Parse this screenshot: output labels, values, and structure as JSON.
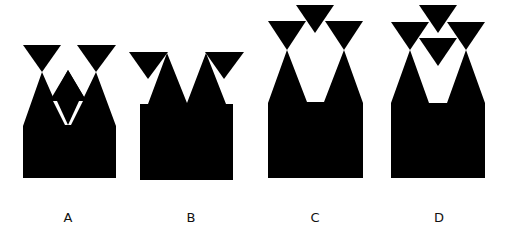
{
  "figures": [
    {
      "id": "A",
      "label": "A",
      "label_x": 68
    },
    {
      "id": "B",
      "label": "B",
      "label_x": 191
    },
    {
      "id": "C",
      "label": "C",
      "label_x": 315
    },
    {
      "id": "D",
      "label": "D",
      "label_x": 439
    }
  ],
  "colors": {
    "shape": "#000000",
    "background": "#ffffff",
    "label": "#111111"
  }
}
